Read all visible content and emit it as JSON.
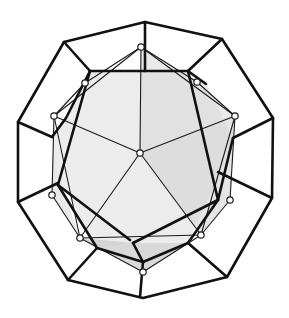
{
  "figure": {
    "title": "",
    "colors": {
      "background": "#ffffff",
      "line": "#111111",
      "shade_light": "#ebebeb",
      "shade_mid": "#dcdcdc",
      "shade_dark": "#cfcfcf",
      "vertex_fill": "#ffffff"
    },
    "outer_decagon": [
      [
        145,
        22
      ],
      [
        222,
        39
      ],
      [
        273,
        118
      ],
      [
        272,
        198
      ],
      [
        227,
        277
      ],
      [
        143,
        298
      ],
      [
        68,
        280
      ],
      [
        18,
        202
      ],
      [
        18,
        122
      ],
      [
        64,
        42
      ]
    ],
    "dodecahedron_outline": [
      [
        90,
        71
      ],
      [
        145,
        71
      ],
      [
        188,
        71
      ],
      [
        206,
        84
      ],
      [
        233,
        138
      ],
      [
        220,
        173
      ],
      [
        188,
        243
      ],
      [
        133,
        243
      ],
      [
        97,
        248
      ],
      [
        60,
        181
      ],
      [
        52,
        137
      ],
      [
        66,
        118
      ]
    ],
    "spokes": [
      [
        [
          145,
          22
        ],
        [
          145,
          71
        ]
      ],
      [
        [
          222,
          39
        ],
        [
          188,
          71
        ]
      ],
      [
        [
          273,
          118
        ],
        [
          233,
          138
        ]
      ],
      [
        [
          272,
          198
        ],
        [
          220,
          173
        ]
      ],
      [
        [
          227,
          277
        ],
        [
          188,
          243
        ]
      ],
      [
        [
          143,
          298
        ],
        [
          140,
          266
        ]
      ],
      [
        [
          68,
          280
        ],
        [
          97,
          248
        ]
      ],
      [
        [
          18,
          202
        ],
        [
          60,
          181
        ]
      ],
      [
        [
          18,
          122
        ],
        [
          52,
          137
        ]
      ],
      [
        [
          64,
          42
        ],
        [
          90,
          71
        ]
      ]
    ],
    "icosahedron_vertices": [
      [
        141,
        47
      ],
      [
        197,
        82
      ],
      [
        235,
        116
      ],
      [
        230,
        200
      ],
      [
        201,
        235
      ],
      [
        143,
        272
      ],
      [
        80,
        238
      ],
      [
        52,
        195
      ],
      [
        54,
        116
      ],
      [
        85,
        83
      ],
      [
        140,
        153
      ]
    ],
    "center_vertex": [
      140,
      153
    ]
  }
}
